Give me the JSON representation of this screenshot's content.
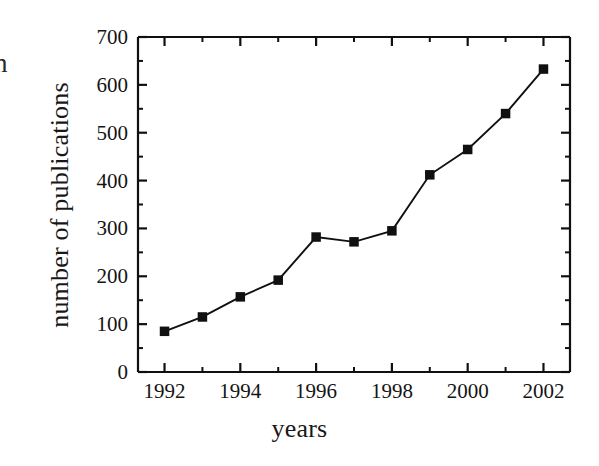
{
  "figure": {
    "clipped_glyph": "n",
    "background_color": "#ffffff",
    "ink_color": "#101010"
  },
  "axes": {
    "x_title": "years",
    "y_title": "number of publications",
    "x_major_ticks": [
      "1992",
      "1994",
      "1996",
      "1998",
      "2000",
      "2002"
    ],
    "y_major_ticks": [
      "0",
      "100",
      "200",
      "300",
      "400",
      "500",
      "600",
      "700"
    ]
  },
  "chart_data": {
    "type": "line",
    "title": "",
    "xlabel": "years",
    "ylabel": "number of publications",
    "xlim": [
      1991.3,
      2002.7
    ],
    "ylim": [
      0,
      700
    ],
    "grid": false,
    "legend": null,
    "marker": "filled-square",
    "marker_color": "#101010",
    "line_color": "#101010",
    "x_tick_labels": [
      "1992",
      "1994",
      "1996",
      "1998",
      "2000",
      "2002"
    ],
    "x_tick_values": [
      1992,
      1994,
      1996,
      1998,
      2000,
      2002
    ],
    "x_minor_tick_values": [
      1993,
      1995,
      1997,
      1999,
      2001
    ],
    "y_tick_labels": [
      "0",
      "100",
      "200",
      "300",
      "400",
      "500",
      "600",
      "700"
    ],
    "y_tick_values": [
      0,
      100,
      200,
      300,
      400,
      500,
      600,
      700
    ],
    "y_minor_tick_values": [
      50,
      150,
      250,
      350,
      450,
      550,
      650
    ],
    "x": [
      1992,
      1993,
      1994,
      1995,
      1996,
      1997,
      1998,
      1999,
      2000,
      2001,
      2002
    ],
    "values": [
      85,
      115,
      157,
      192,
      282,
      272,
      295,
      412,
      465,
      540,
      633
    ],
    "series": [
      {
        "name": "number of publications",
        "values": [
          85,
          115,
          157,
          192,
          282,
          272,
          295,
          412,
          465,
          540,
          633
        ]
      }
    ]
  }
}
